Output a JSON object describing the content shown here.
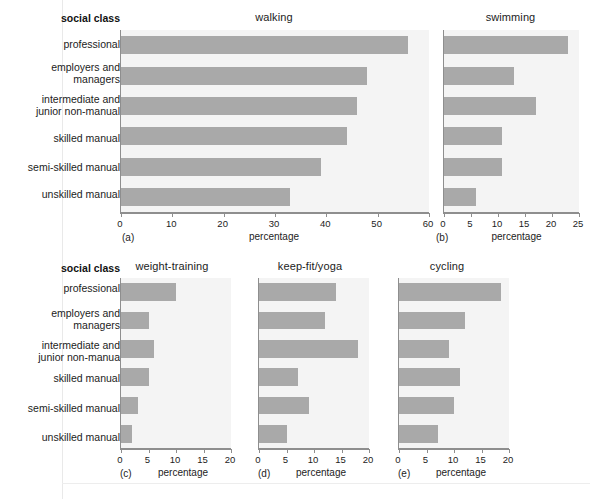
{
  "figure": {
    "category_header": "social class",
    "categories": [
      "professional",
      "employers and\nmanagers",
      "intermediate and\njunior non-manual",
      "skilled manual",
      "semi-skilled manual",
      "unskilled manual"
    ],
    "categories_bottom": [
      "professional",
      "employers and\nmanagers",
      "intermediate and\njunior non-manua",
      "skilled manual",
      "semi-skilled manual",
      "unskilled manual"
    ],
    "xlabel": "percentage",
    "bar_color": "#a9a9a9",
    "plot_bg": "#f4f4f4",
    "axis_color": "#8e8e8e"
  },
  "chart_data": [
    {
      "type": "bar",
      "orientation": "horizontal",
      "panel": "(a)",
      "title": "walking",
      "categories": [
        "professional",
        "employers and managers",
        "intermediate and junior non-manual",
        "skilled manual",
        "semi-skilled manual",
        "unskilled manual"
      ],
      "values": [
        56,
        48,
        46,
        44,
        39,
        33
      ],
      "xlabel": "percentage",
      "ylabel": "social class",
      "xlim": [
        0,
        60
      ],
      "xticks": [
        0,
        10,
        20,
        30,
        40,
        50,
        60
      ],
      "grid": false,
      "legend": "none"
    },
    {
      "type": "bar",
      "orientation": "horizontal",
      "panel": "(b)",
      "title": "swimming",
      "categories": [
        "professional",
        "employers and managers",
        "intermediate and junior non-manual",
        "skilled manual",
        "semi-skilled manual",
        "unskilled manual"
      ],
      "values": [
        23,
        13,
        17,
        10.8,
        10.8,
        6
      ],
      "xlabel": "percentage",
      "ylabel": "social class",
      "xlim": [
        0,
        25
      ],
      "xticks": [
        0,
        5,
        10,
        15,
        20,
        25
      ],
      "grid": false,
      "legend": "none"
    },
    {
      "type": "bar",
      "orientation": "horizontal",
      "panel": "(c)",
      "title": "weight-training",
      "categories": [
        "professional",
        "employers and managers",
        "intermediate and junior non-manua",
        "skilled manual",
        "semi-skilled manual",
        "unskilled manual"
      ],
      "values": [
        10,
        5,
        6,
        5,
        3,
        2
      ],
      "xlabel": "percentage",
      "ylabel": "social class",
      "xlim": [
        0,
        20
      ],
      "xticks": [
        0,
        5,
        10,
        15,
        20
      ],
      "grid": false,
      "legend": "none"
    },
    {
      "type": "bar",
      "orientation": "horizontal",
      "panel": "(d)",
      "title": "keep-fit/yoga",
      "categories": [
        "professional",
        "employers and managers",
        "intermediate and junior non-manua",
        "skilled manual",
        "semi-skilled manual",
        "unskilled manual"
      ],
      "values": [
        14,
        12,
        18,
        7,
        9,
        5
      ],
      "xlabel": "percentage",
      "ylabel": "social class",
      "xlim": [
        0,
        20
      ],
      "xticks": [
        0,
        5,
        10,
        15,
        20
      ],
      "grid": false,
      "legend": "none"
    },
    {
      "type": "bar",
      "orientation": "horizontal",
      "panel": "(e)",
      "title": "cycling",
      "categories": [
        "professional",
        "employers and managers",
        "intermediate and junior non-manua",
        "skilled manual",
        "semi-skilled manual",
        "unskilled manual"
      ],
      "values": [
        18.5,
        12,
        9,
        11,
        10,
        7
      ],
      "xlabel": "percentage",
      "ylabel": "social class",
      "xlim": [
        0,
        20
      ],
      "xticks": [
        0,
        5,
        10,
        15,
        20
      ],
      "grid": false,
      "legend": "none"
    }
  ]
}
